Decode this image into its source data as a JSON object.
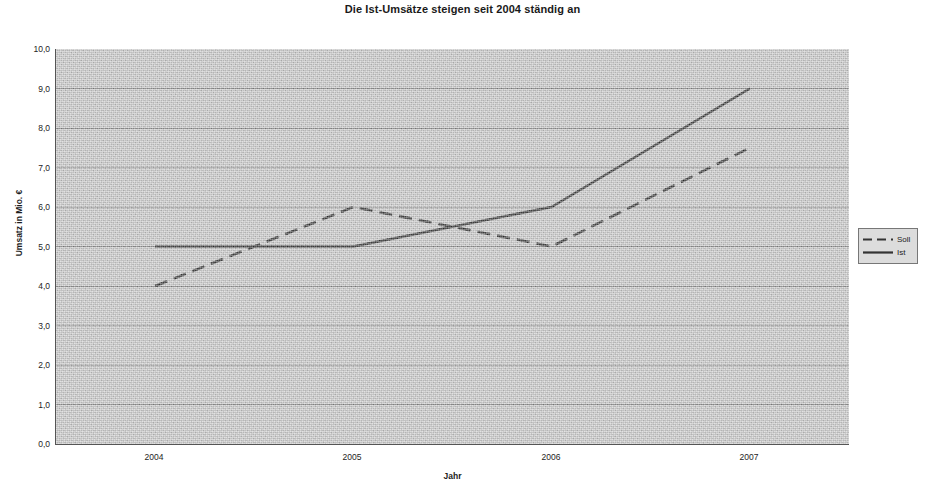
{
  "chart_data": {
    "type": "line",
    "title": "Die Ist-Umsätze steigen seit 2004 ständig an",
    "xlabel": "Jahr",
    "ylabel": "Umsatz in Mio. €",
    "categories": [
      "2004",
      "2005",
      "2006",
      "2007"
    ],
    "series": [
      {
        "name": "Soll",
        "values": [
          4.0,
          6.0,
          5.0,
          7.5
        ],
        "style": "dashed",
        "color": "#333333"
      },
      {
        "name": "Ist",
        "values": [
          5.0,
          5.0,
          6.0,
          9.0
        ],
        "style": "solid",
        "color": "#333333"
      }
    ],
    "ylim": [
      0.0,
      10.0
    ],
    "ytick_labels": [
      "10,0",
      "9,0",
      "8,0",
      "7,0",
      "6,0",
      "5,0",
      "4,0",
      "3,0",
      "2,0",
      "1,0",
      "0,0"
    ],
    "ytick_values": [
      10.0,
      9.0,
      8.0,
      7.0,
      6.0,
      5.0,
      4.0,
      3.0,
      2.0,
      1.0,
      0.0
    ],
    "grid": true,
    "legend_position": "right",
    "plot_background": "#c9c9c9",
    "grid_color": "#8a8a8a",
    "axis_color": "#555555"
  }
}
